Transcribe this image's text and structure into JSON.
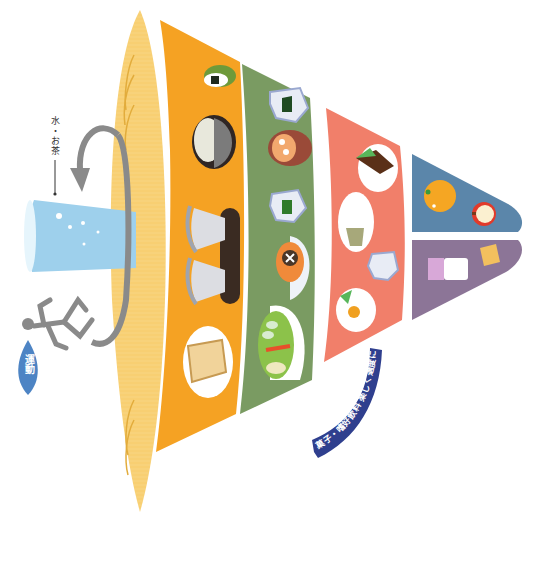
{
  "diagram": {
    "type": "food-guide-spinning-top",
    "orientation": "rotated-90-clockwise",
    "colors": {
      "water_band": "#f8cf72",
      "grains": "#f5a223",
      "vegetables": "#7a9b62",
      "meat_fish": "#f17f6a",
      "fruits": "#5b86aa",
      "dairy": "#8c7597",
      "ribbon": "#2f3f8e",
      "exercise_drop": "#4d84c4",
      "water_glass": "#9ed0ec",
      "arrow": "#8a8a8a"
    },
    "labels": {
      "water_tea": "水・お茶",
      "exercise": "運動",
      "snacks_ribbon": "菓子・嗜好飲料 楽しく適度に"
    },
    "sections": [
      {
        "name": "grains",
        "items": [
          "onigiri",
          "udon-bowl",
          "rice-bowl",
          "rice-bowl",
          "bread"
        ]
      },
      {
        "name": "vegetables",
        "items": [
          "spinach-side",
          "miso-soup",
          "vegetable-side",
          "simmered-dish",
          "salad"
        ]
      },
      {
        "name": "meat-fish-egg-soy",
        "items": [
          "grilled-fish",
          "tofu-dish",
          "natto",
          "fried-egg"
        ]
      },
      {
        "name": "fruits",
        "items": [
          "orange",
          "apple"
        ]
      },
      {
        "name": "milk-dairy",
        "items": [
          "milk",
          "cheese"
        ]
      }
    ]
  }
}
